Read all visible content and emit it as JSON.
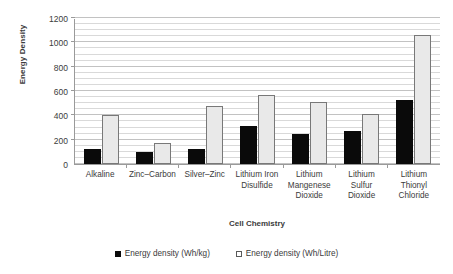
{
  "chart_data": {
    "type": "bar",
    "title": "",
    "xlabel": "Cell Chemistry",
    "ylabel": "Energy Density",
    "ylim": [
      0,
      1200
    ],
    "y_ticks": [
      0,
      200,
      400,
      600,
      800,
      1000,
      1200
    ],
    "y_minor_step": 50,
    "grid": true,
    "legend_position": "bottom",
    "categories": [
      "Alkaline",
      "Zinc–Carbon",
      "Silver–Zinc",
      "Lithium Iron Disulfide",
      "Lithium Mangenese Dioxide",
      "Lithium Sulfur Dioxide",
      "Lithium Thionyl Chloride"
    ],
    "category_label_lines": [
      [
        "Alkaline"
      ],
      [
        "Zinc–Carbon"
      ],
      [
        "Silver–Zinc"
      ],
      [
        "Lithium Iron",
        "Disulfide"
      ],
      [
        "Lithium",
        "Mangenese",
        "Dioxide"
      ],
      [
        "Lithium",
        "Sulfur",
        "Dioxide"
      ],
      [
        "Lithium",
        "Thionyl",
        "Chloride"
      ]
    ],
    "series": [
      {
        "name": "Energy density (Wh/kg)",
        "color": "#0a0a0a",
        "values": [
          125,
          100,
          125,
          310,
          245,
          270,
          530
        ]
      },
      {
        "name": "Energy density (Wh/Litre)",
        "color": "#e9e9e9",
        "values": [
          400,
          175,
          475,
          565,
          510,
          410,
          1060
        ]
      }
    ]
  },
  "legend": {
    "items": [
      {
        "label": "Energy density (Wh/kg)",
        "swatch": "filled-square-icon"
      },
      {
        "label": "Energy density (Wh/Litre)",
        "swatch": "hollow-square-icon"
      }
    ]
  },
  "axes": {
    "y_title": "Energy Density",
    "x_title": "Cell Chemistry"
  }
}
